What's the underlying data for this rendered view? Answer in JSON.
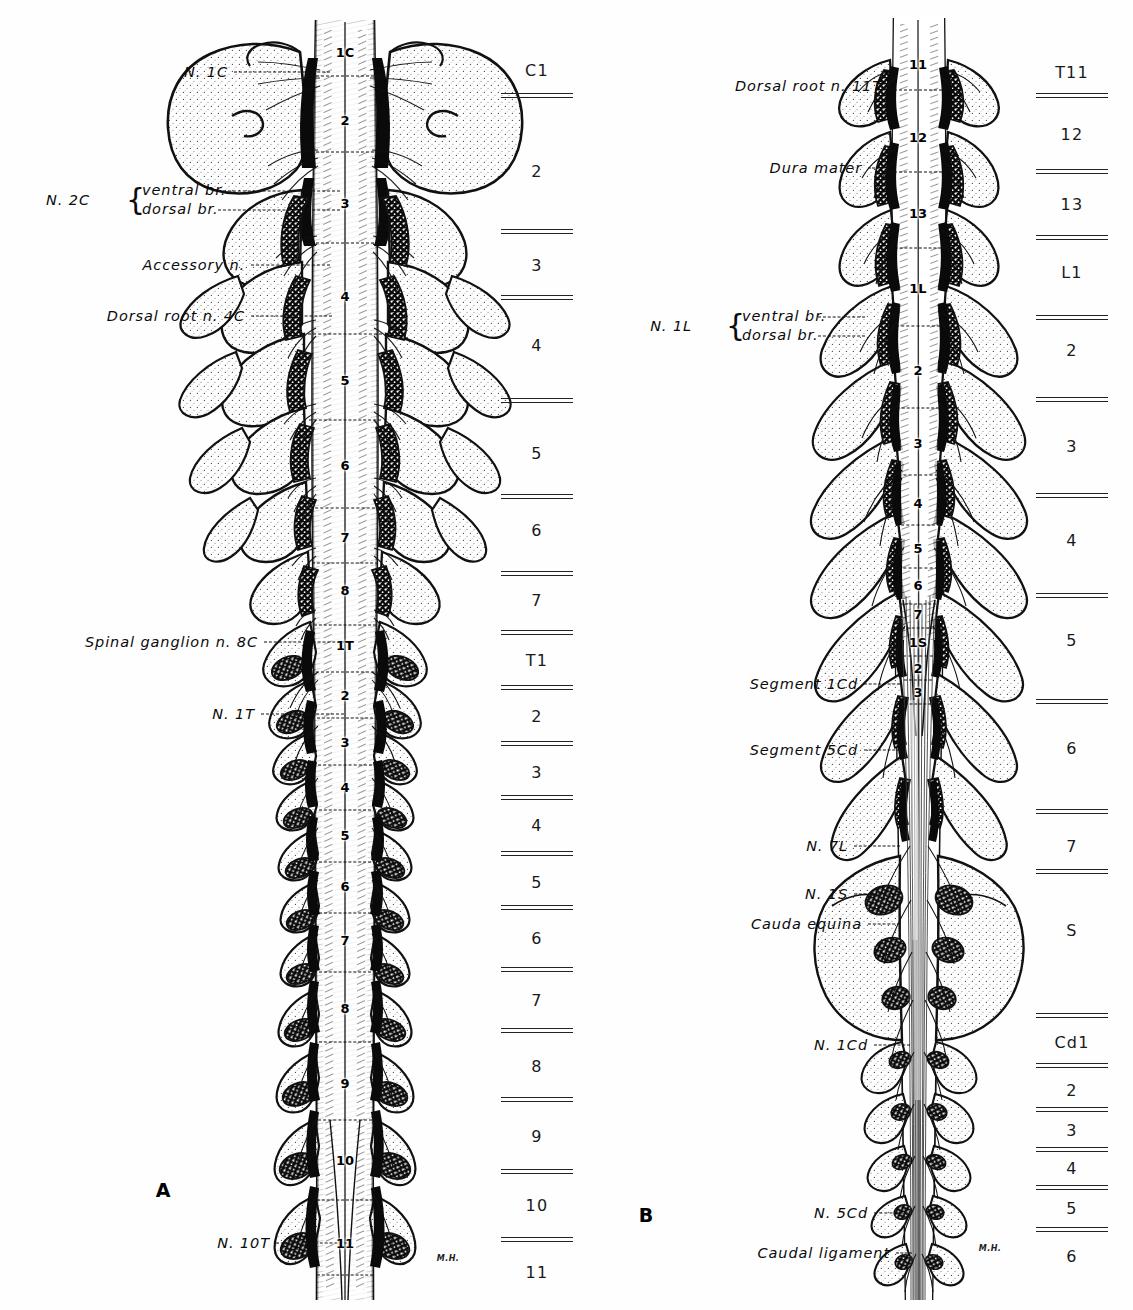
{
  "figure": {
    "background": "#ffffff",
    "ink": "#0b0b0b",
    "signature": "M.H."
  },
  "panel_a": {
    "letter": "A",
    "signature": "M.H.",
    "labels": [
      {
        "text": "N. 1C",
        "x": 228,
        "y": 72,
        "leader_to": 330
      },
      {
        "text": "Accessory n.",
        "x": 245,
        "y": 265,
        "leader_to": 330
      },
      {
        "text": "Dorsal root n. 4C",
        "x": 245,
        "y": 316,
        "leader_to": 332
      },
      {
        "text": "Spinal ganglion n. 8C",
        "x": 258,
        "y": 642,
        "leader_to": 345
      },
      {
        "text": "N. 1T",
        "x": 255,
        "y": 714,
        "leader_to": 344
      },
      {
        "text": "N. 10T",
        "x": 270,
        "y": 1243,
        "leader_to": 352
      }
    ],
    "brace_label": {
      "prefix": "N. 2C",
      "prefix_x": 90,
      "y": 200,
      "brace_x": 140,
      "rows": [
        {
          "text": "ventral br.",
          "leader_to": 340
        },
        {
          "text": "dorsal br.",
          "leader_to": 340
        }
      ]
    },
    "scale": {
      "x": 537,
      "items": [
        {
          "label": "C1",
          "y": 70
        },
        {
          "rule": true,
          "y": 96
        },
        {
          "label": "2",
          "y": 171
        },
        {
          "rule": true,
          "y": 232
        },
        {
          "label": "3",
          "y": 265
        },
        {
          "rule": true,
          "y": 298
        },
        {
          "label": "4",
          "y": 345
        },
        {
          "rule": true,
          "y": 401
        },
        {
          "label": "5",
          "y": 453
        },
        {
          "rule": true,
          "y": 497
        },
        {
          "label": "6",
          "y": 530
        },
        {
          "rule": true,
          "y": 574
        },
        {
          "label": "7",
          "y": 600
        },
        {
          "rule": true,
          "y": 633
        },
        {
          "label": "T1",
          "y": 660
        },
        {
          "rule": true,
          "y": 688
        },
        {
          "label": "2",
          "y": 716
        },
        {
          "rule": true,
          "y": 744
        },
        {
          "label": "3",
          "y": 772
        },
        {
          "rule": true,
          "y": 798
        },
        {
          "label": "4",
          "y": 825
        },
        {
          "rule": true,
          "y": 854
        },
        {
          "label": "5",
          "y": 882
        },
        {
          "rule": true,
          "y": 908
        },
        {
          "label": "6",
          "y": 938
        },
        {
          "rule": true,
          "y": 970
        },
        {
          "label": "7",
          "y": 1000
        },
        {
          "rule": true,
          "y": 1031
        },
        {
          "label": "8",
          "y": 1066
        },
        {
          "rule": true,
          "y": 1100
        },
        {
          "label": "9",
          "y": 1136
        },
        {
          "rule": true,
          "y": 1172
        },
        {
          "label": "10",
          "y": 1205
        },
        {
          "rule": true,
          "y": 1240
        },
        {
          "label": "11",
          "y": 1272
        }
      ]
    },
    "cord_segments": {
      "x": 345,
      "items": [
        {
          "label": "1C",
          "y": 52,
          "tick_y": 76,
          "tick_w": 78
        },
        {
          "label": "2",
          "y": 120,
          "tick_y": 152,
          "tick_w": 78
        },
        {
          "label": "3",
          "y": 203,
          "tick_y": 243,
          "tick_w": 78
        },
        {
          "label": "4",
          "y": 296,
          "tick_y": 334,
          "tick_w": 74
        },
        {
          "label": "5",
          "y": 380,
          "tick_y": 420,
          "tick_w": 72
        },
        {
          "label": "6",
          "y": 465,
          "tick_y": 508,
          "tick_w": 70
        },
        {
          "label": "7",
          "y": 537,
          "tick_y": 563,
          "tick_w": 66
        },
        {
          "label": "8",
          "y": 590,
          "tick_y": 625,
          "tick_w": 62
        },
        {
          "label": "1T",
          "y": 645,
          "tick_y": 672,
          "tick_w": 58
        },
        {
          "label": "2",
          "y": 695,
          "tick_y": 718,
          "tick_w": 56
        },
        {
          "label": "3",
          "y": 742,
          "tick_y": 765,
          "tick_w": 54
        },
        {
          "label": "4",
          "y": 787,
          "tick_y": 810,
          "tick_w": 52
        },
        {
          "label": "5",
          "y": 835,
          "tick_y": 862,
          "tick_w": 52
        },
        {
          "label": "6",
          "y": 886,
          "tick_y": 913,
          "tick_w": 52
        },
        {
          "label": "7",
          "y": 940,
          "tick_y": 972,
          "tick_w": 52
        },
        {
          "label": "8",
          "y": 1008,
          "tick_y": 1042,
          "tick_w": 52
        },
        {
          "label": "9",
          "y": 1083,
          "tick_y": 1120,
          "tick_w": 54
        },
        {
          "label": "10",
          "y": 1160,
          "tick_y": 1200,
          "tick_w": 56
        },
        {
          "label": "11",
          "y": 1243,
          "tick_y": 1275,
          "tick_w": 56
        }
      ]
    }
  },
  "panel_b": {
    "letter": "B",
    "signature": "M.H.",
    "labels": [
      {
        "text": "Dorsal root n. 11T",
        "x": 282,
        "y": 86,
        "leader_to": 290
      },
      {
        "text": "Dura mater",
        "x": 262,
        "y": 168,
        "leader_to": 283
      },
      {
        "text": "Segment 1Cd",
        "x": 258,
        "y": 684,
        "leader_to": 300
      },
      {
        "text": "Segment 5Cd",
        "x": 258,
        "y": 750,
        "leader_to": 300
      },
      {
        "text": "N. 7L",
        "x": 248,
        "y": 846,
        "leader_to": 300
      },
      {
        "text": "N. 1S",
        "x": 248,
        "y": 894,
        "leader_to": 300
      },
      {
        "text": "Cauda equina",
        "x": 262,
        "y": 924,
        "leader_to": 300
      },
      {
        "text": "N. 1Cd",
        "x": 268,
        "y": 1045,
        "leader_to": 310
      },
      {
        "text": "N. 5Cd",
        "x": 268,
        "y": 1213,
        "leader_to": 308
      },
      {
        "text": "Caudal ligament",
        "x": 290,
        "y": 1253,
        "leader_to": 312
      }
    ],
    "brace_label": {
      "prefix": "N. 1L",
      "prefix_x": 92,
      "y": 326,
      "brace_x": 140,
      "rows": [
        {
          "text": "ventral br.",
          "leader_to": 265
        },
        {
          "text": "dorsal br.",
          "leader_to": 265
        }
      ]
    },
    "scale": {
      "x": 472,
      "items": [
        {
          "label": "T11",
          "y": 72
        },
        {
          "rule": true,
          "y": 96
        },
        {
          "label": "12",
          "y": 134
        },
        {
          "rule": true,
          "y": 172
        },
        {
          "label": "13",
          "y": 204
        },
        {
          "rule": true,
          "y": 238
        },
        {
          "label": "L1",
          "y": 272
        },
        {
          "rule": true,
          "y": 318
        },
        {
          "label": "2",
          "y": 350
        },
        {
          "rule": true,
          "y": 400
        },
        {
          "label": "3",
          "y": 446
        },
        {
          "rule": true,
          "y": 496
        },
        {
          "label": "4",
          "y": 540
        },
        {
          "rule": true,
          "y": 596
        },
        {
          "label": "5",
          "y": 640
        },
        {
          "rule": true,
          "y": 702
        },
        {
          "label": "6",
          "y": 748
        },
        {
          "rule": true,
          "y": 812
        },
        {
          "label": "7",
          "y": 846
        },
        {
          "rule": true,
          "y": 872
        },
        {
          "label": "S",
          "y": 930
        },
        {
          "rule": true,
          "y": 1016
        },
        {
          "label": "Cd1",
          "y": 1042
        },
        {
          "rule": true,
          "y": 1066
        },
        {
          "label": "2",
          "y": 1090
        },
        {
          "rule": true,
          "y": 1110
        },
        {
          "label": "3",
          "y": 1130
        },
        {
          "rule": true,
          "y": 1150
        },
        {
          "label": "4",
          "y": 1168
        },
        {
          "rule": true,
          "y": 1188
        },
        {
          "label": "5",
          "y": 1208
        },
        {
          "rule": true,
          "y": 1230
        },
        {
          "label": "6",
          "y": 1256
        }
      ]
    },
    "cord_segments": {
      "x": 318,
      "items": [
        {
          "label": "11",
          "y": 64,
          "tick_y": 90,
          "tick_w": 58
        },
        {
          "label": "12",
          "y": 137,
          "tick_y": 172,
          "tick_w": 58
        },
        {
          "label": "13",
          "y": 213,
          "tick_y": 248,
          "tick_w": 56
        },
        {
          "label": "1L",
          "y": 288,
          "tick_y": 326,
          "tick_w": 54
        },
        {
          "label": "2",
          "y": 370,
          "tick_y": 408,
          "tick_w": 52
        },
        {
          "label": "3",
          "y": 443,
          "tick_y": 475,
          "tick_w": 50
        },
        {
          "label": "4",
          "y": 503,
          "tick_y": 525,
          "tick_w": 44
        },
        {
          "label": "5",
          "y": 548,
          "tick_y": 568,
          "tick_w": 40
        },
        {
          "label": "6",
          "y": 585,
          "tick_y": 604,
          "tick_w": 36
        },
        {
          "label": "7",
          "y": 614,
          "tick_y": 628,
          "tick_w": 32
        },
        {
          "label": "1S",
          "y": 642,
          "tick_y": 656,
          "tick_w": 30
        },
        {
          "label": "2",
          "y": 668,
          "tick_y": 680,
          "tick_w": 28
        },
        {
          "label": "3",
          "y": 692,
          "tick_y": 704,
          "tick_w": 26
        }
      ]
    }
  }
}
